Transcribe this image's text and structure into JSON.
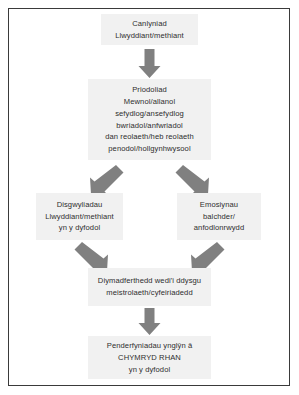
{
  "diagram": {
    "type": "flowchart",
    "language": "cy",
    "colors": {
      "node_fill": "#f1f1f1",
      "arrow_fill": "#808080",
      "text": "#2e2e2e",
      "frame_border": "#3a3a3a",
      "page_background": "#ffffff"
    },
    "nodes": [
      {
        "id": "outcome",
        "lines": [
          "Canlyniad",
          "Llwyddiant/methiant"
        ]
      },
      {
        "id": "attribution",
        "lines": [
          "Priodoliad",
          "Mewnol/allanol",
          "sefydlog/ansefydlog",
          "bwriadol/anfwriadol",
          "dan reolaeth/heb reolaeth",
          "penodol/hollgynhwysool"
        ]
      },
      {
        "id": "expectations",
        "lines": [
          "Disgwyliadau",
          "Llwyddiant/methiant",
          "yn y dyfodol"
        ]
      },
      {
        "id": "emotions",
        "lines": [
          "Emosiynau",
          "balchder/",
          "anfodlonrwydd"
        ]
      },
      {
        "id": "helplessness",
        "lines": [
          "Diymadferthedd wedi'i ddysgu",
          "meistrolaeth/cyfeiriadedd"
        ]
      },
      {
        "id": "decisions",
        "lines": [
          "Penderfyniadau ynglŷn â",
          "CHYMRYD RHAN",
          "yn y dyfodol"
        ]
      }
    ],
    "edges": [
      {
        "id": "outcome-to-attribution",
        "from": "outcome",
        "to": "attribution",
        "direction": "down"
      },
      {
        "id": "attribution-to-expectations",
        "from": "attribution",
        "to": "expectations",
        "direction": "down-left"
      },
      {
        "id": "attribution-to-emotions",
        "from": "attribution",
        "to": "emotions",
        "direction": "down-right"
      },
      {
        "id": "expectations-to-helplessness",
        "from": "expectations",
        "to": "helplessness",
        "direction": "down-right"
      },
      {
        "id": "emotions-to-helplessness",
        "from": "emotions",
        "to": "helplessness",
        "direction": "down-left"
      },
      {
        "id": "helplessness-to-decisions",
        "from": "helplessness",
        "to": "decisions",
        "direction": "down"
      }
    ]
  }
}
